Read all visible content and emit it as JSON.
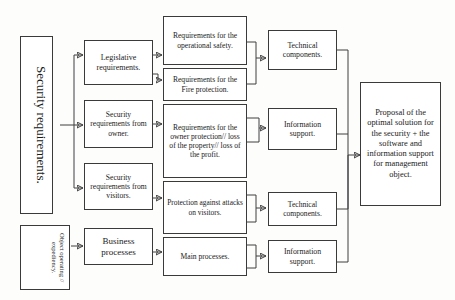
{
  "diagram": {
    "accent_color": "#3a3a3a",
    "background_color": "#fdfdfc",
    "nodes": {
      "security_requirements": "Security requirements.",
      "object_operating": "Object operating // expediency.",
      "legislative_requirements": "Legislative requirements.",
      "security_req_owner": "Security requirements from owner.",
      "security_req_visitors": "Security requirements from visitors.",
      "business_processes": "Business processes",
      "req_operational_safety": "Requirements for the operational safety.",
      "req_fire_protection": "Requirements for the Fire protection.",
      "req_owner_protection": "Requirements for the owner protection// loss of the property// loss of the profit.",
      "protection_attacks_visitors": "Protection against attacks on visitors.",
      "main_processes": "Main processes.",
      "technical_components_top": "Technical components.",
      "information_support_top": "Information support.",
      "technical_components_bottom": "Technical components.",
      "information_support_bottom": "Information support.",
      "proposal": "Proposal of the optimal solution for the security + the software and information support for management object."
    }
  }
}
